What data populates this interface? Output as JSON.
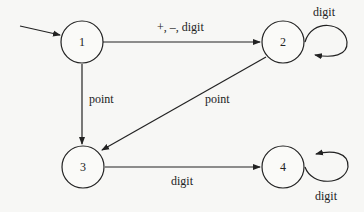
{
  "diagram": {
    "type": "finite-state-automaton",
    "stroke_color": "#222222",
    "background": "#f7f7f5",
    "states": [
      {
        "id": "1",
        "label": "1",
        "start": true
      },
      {
        "id": "2",
        "label": "2"
      },
      {
        "id": "3",
        "label": "3"
      },
      {
        "id": "4",
        "label": "4"
      }
    ],
    "transitions": [
      {
        "from": "1",
        "to": "2",
        "label": "+, –, digit"
      },
      {
        "from": "2",
        "to": "2",
        "label": "digit"
      },
      {
        "from": "1",
        "to": "3",
        "label": "point"
      },
      {
        "from": "2",
        "to": "3",
        "label": "point"
      },
      {
        "from": "3",
        "to": "4",
        "label": "digit"
      },
      {
        "from": "4",
        "to": "4",
        "label": "digit"
      }
    ]
  }
}
